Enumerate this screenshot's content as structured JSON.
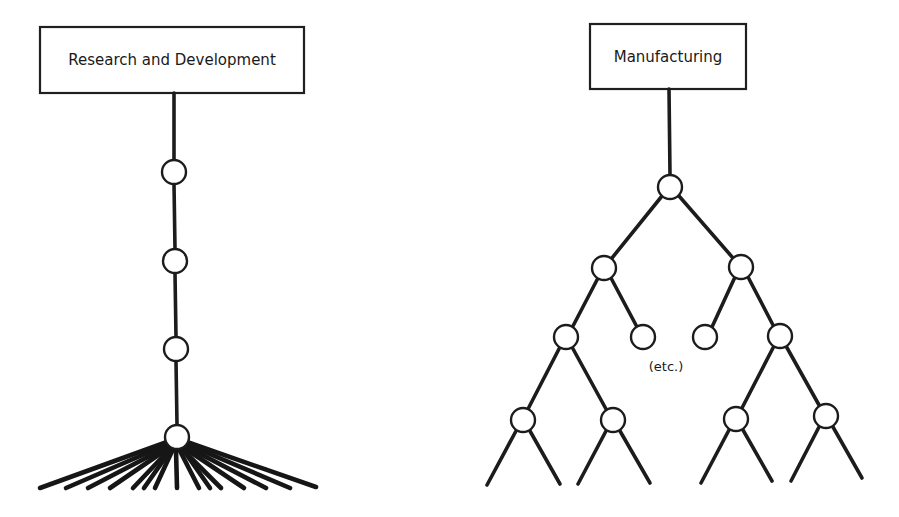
{
  "diagram": {
    "left": {
      "title": "Research and Development",
      "structure": "linear chain ending in a wide fan",
      "nodes": [
        {
          "id": "rd-1",
          "x": 174,
          "y": 172
        },
        {
          "id": "rd-2",
          "x": 175,
          "y": 261
        },
        {
          "id": "rd-3",
          "x": 176,
          "y": 349
        },
        {
          "id": "rd-fan-hub",
          "x": 177,
          "y": 437
        }
      ],
      "fan_ray_count": 15
    },
    "right": {
      "title": "Manufacturing",
      "structure": "binary tree",
      "annotation": "(etc.)",
      "levels": [
        [
          {
            "id": "m-root",
            "x": 670,
            "y": 187
          }
        ],
        [
          {
            "id": "m-l2-a",
            "x": 604,
            "y": 268
          },
          {
            "id": "m-l2-b",
            "x": 741,
            "y": 267
          }
        ],
        [
          {
            "id": "m-l3-a",
            "x": 566,
            "y": 337
          },
          {
            "id": "m-l3-b",
            "x": 643,
            "y": 337
          },
          {
            "id": "m-l3-c",
            "x": 705,
            "y": 337
          },
          {
            "id": "m-l3-d",
            "x": 780,
            "y": 336
          }
        ],
        [
          {
            "id": "m-l4-a",
            "x": 523,
            "y": 420
          },
          {
            "id": "m-l4-b",
            "x": 613,
            "y": 420
          },
          {
            "id": "m-l4-c",
            "x": 736,
            "y": 419
          },
          {
            "id": "m-l4-d",
            "x": 826,
            "y": 416
          }
        ]
      ]
    },
    "colors": {
      "ink": "#1c1c1c",
      "background": "#ffffff"
    }
  }
}
